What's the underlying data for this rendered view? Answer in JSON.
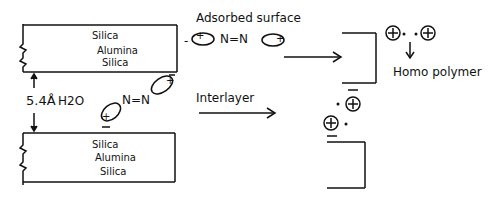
{
  "diagram": {
    "top_clay_layer": {
      "lines": [
        "Silica",
        "Alumina",
        "Silica"
      ]
    },
    "bottom_clay_layer": {
      "lines": [
        "Silica",
        "Alumina",
        "Silica"
      ]
    },
    "spacing_label": "5.4Å H2O",
    "spacing_value": "5.4Å",
    "water_label": "H2O",
    "adsorbed_surface_label": "Adsorbed surface",
    "interlayer_label": "Interlayer",
    "homo_polymer_label": "Homo polymer",
    "azo_bond_label": "N=N",
    "surface_molecule": {
      "left_charge": "-",
      "bond": "N=N",
      "ring_charge": "+"
    },
    "interlayer_molecule": {
      "bond": "N=N",
      "ring_charge": "+",
      "counter_charge": "-"
    },
    "radical_cation_symbol": "⊕",
    "radical_dot": "•",
    "colors": {
      "ink": "#111111",
      "background": "#ffffff"
    }
  }
}
